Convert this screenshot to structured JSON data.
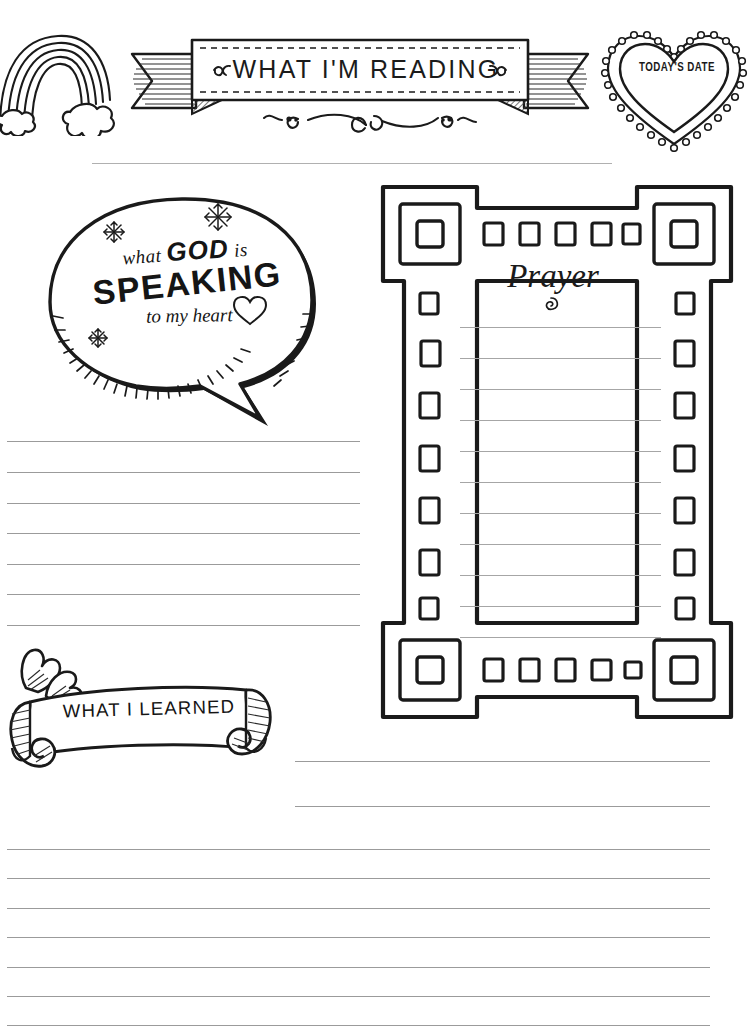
{
  "page": {
    "background_color": "#ffffff",
    "ink_color": "#1a1a1a",
    "rule_color": "#9b9b9b",
    "width": 756,
    "height": 1032
  },
  "header": {
    "banner_title": "WHAT I'M READING",
    "banner_left_flourish": "~",
    "banner_right_flourish": "~",
    "flourish_below": "filigree-flourish",
    "rainbow_icon": "rainbow-with-clouds-icon",
    "date_heart": {
      "label": "TODAY'S DATE",
      "icon": "scalloped-heart-icon"
    },
    "date_line": {
      "name": "date-write-line",
      "value": ""
    }
  },
  "speech_bubble": {
    "icon": "speech-bubble-icon",
    "line1_pre": "what ",
    "line1_emph": "GOD",
    "line1_post": " is",
    "line2": "SPEAKING",
    "line3": "to my heart",
    "heart_glyph": "♡",
    "doodles": [
      "snowflake-doodle",
      "snowflake-doodle",
      "snowflake-doodle"
    ]
  },
  "prayer_section": {
    "title": "Prayer",
    "frame_icon": "doodle-square-frame",
    "line_count": 11,
    "lines": [
      "",
      "",
      "",
      "",
      "",
      "",
      "",
      "",
      "",
      "",
      ""
    ]
  },
  "reading_notes": {
    "line_count": 7,
    "lines": [
      "",
      "",
      "",
      "",
      "",
      "",
      ""
    ]
  },
  "learned_section": {
    "title": "WHAT I LEARNED",
    "scroll_icon": "rolled-scroll-banner-icon",
    "short_line_count": 2,
    "short_lines": [
      "",
      ""
    ],
    "full_line_count": 9,
    "full_lines": [
      "",
      "",
      "",
      "",
      "",
      "",
      "",
      "",
      ""
    ]
  }
}
